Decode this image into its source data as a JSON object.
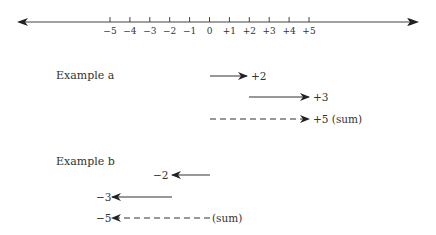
{
  "number_line": {
    "ticks": [
      "−5",
      "−4",
      "−3",
      "−2",
      "−1",
      "0",
      "+1",
      "+2",
      "+3",
      "+4",
      "+5"
    ]
  },
  "example_a": {
    "title": "Example a",
    "arrows": [
      {
        "label": "+2",
        "from": 0,
        "to": 2,
        "style": "solid"
      },
      {
        "label": "+3",
        "from": 2,
        "to": 5,
        "style": "solid"
      },
      {
        "label": "+5 (sum)",
        "from": 0,
        "to": 5,
        "style": "dashed"
      }
    ]
  },
  "example_b": {
    "title": "Example b",
    "arrows": [
      {
        "label": "−2",
        "from": 0,
        "to": -2,
        "style": "solid"
      },
      {
        "label": "−3",
        "from": -2,
        "to": -5,
        "style": "solid"
      },
      {
        "label": "−5",
        "suffix": "(sum)",
        "from": 0,
        "to": -5,
        "style": "dashed"
      }
    ]
  }
}
